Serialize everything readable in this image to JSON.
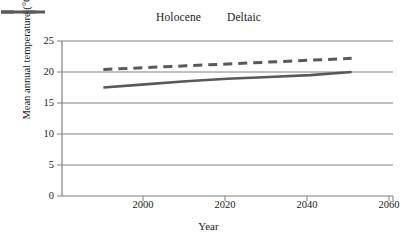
{
  "chart_data": {
    "type": "line",
    "title": "",
    "xlabel": "Year",
    "ylabel": "Mean annual temperature (°C)",
    "xlim": [
      1990,
      2070
    ],
    "ylim": [
      0,
      25
    ],
    "yticks": [
      0,
      5,
      10,
      15,
      20,
      25
    ],
    "xticks": [
      2000,
      2020,
      2040,
      2060
    ],
    "grid": "horizontal",
    "legend_position": "top-center",
    "series": [
      {
        "name": "Holocene",
        "style": "solid",
        "color": "#595959",
        "x": [
          2000,
          2010,
          2020,
          2030,
          2040,
          2050,
          2060
        ],
        "values": [
          17.5,
          18.0,
          18.5,
          18.9,
          19.2,
          19.5,
          20.0
        ]
      },
      {
        "name": "Deltaic",
        "style": "dashed",
        "color": "#595959",
        "x": [
          2000,
          2010,
          2020,
          2030,
          2040,
          2050,
          2060
        ],
        "values": [
          20.4,
          20.7,
          21.0,
          21.3,
          21.6,
          21.9,
          22.2
        ]
      }
    ]
  },
  "legend": {
    "holocene_label": "Holocene",
    "deltaic_label": "Deltaic"
  },
  "axes": {
    "y_title": "Mean annual temperature (°C)",
    "x_title": "Year",
    "y_tick_labels": [
      "0",
      "5",
      "10",
      "15",
      "20",
      "25"
    ],
    "x_tick_labels": [
      "2000",
      "2020",
      "2040",
      "2060"
    ]
  },
  "colors": {
    "line": "#595959",
    "grid": "#808080",
    "axis": "#808080",
    "background": "#ffffff"
  }
}
